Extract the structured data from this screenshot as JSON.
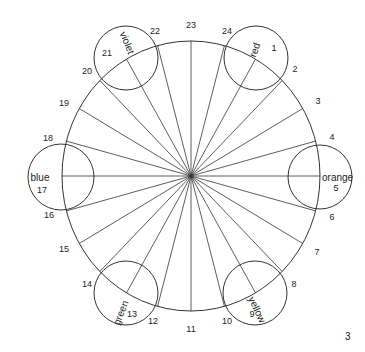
{
  "diagram": {
    "center": {
      "x": 191,
      "y": 176
    },
    "main_circle": {
      "rx": 129,
      "ry": 135
    },
    "stroke_color": "#333333",
    "page_number": "3",
    "segments": [
      {
        "n": "1",
        "x": 274,
        "y": 51
      },
      {
        "n": "2",
        "x": 295,
        "y": 72
      },
      {
        "n": "3",
        "x": 318,
        "y": 104
      },
      {
        "n": "4",
        "x": 332,
        "y": 140
      },
      {
        "n": "5",
        "x": 336,
        "y": 191
      },
      {
        "n": "6",
        "x": 332,
        "y": 220
      },
      {
        "n": "7",
        "x": 317,
        "y": 255
      },
      {
        "n": "8",
        "x": 294,
        "y": 287
      },
      {
        "n": "9",
        "x": 252,
        "y": 317
      },
      {
        "n": "10",
        "x": 227,
        "y": 324
      },
      {
        "n": "11",
        "x": 191,
        "y": 332
      },
      {
        "n": "12",
        "x": 153,
        "y": 324
      },
      {
        "n": "13",
        "x": 132,
        "y": 317
      },
      {
        "n": "14",
        "x": 87,
        "y": 287
      },
      {
        "n": "15",
        "x": 64,
        "y": 252
      },
      {
        "n": "16",
        "x": 49,
        "y": 218
      },
      {
        "n": "17",
        "x": 42,
        "y": 193
      },
      {
        "n": "18",
        "x": 48,
        "y": 141
      },
      {
        "n": "19",
        "x": 64,
        "y": 106
      },
      {
        "n": "20",
        "x": 87,
        "y": 74
      },
      {
        "n": "21",
        "x": 107,
        "y": 56
      },
      {
        "n": "22",
        "x": 155,
        "y": 34
      },
      {
        "n": "23",
        "x": 191,
        "y": 28
      },
      {
        "n": "24",
        "x": 227,
        "y": 34
      }
    ],
    "color_circles": [
      {
        "label": "red",
        "cx": 256,
        "cy": 58,
        "r": 32,
        "tx": 258,
        "ty": 51,
        "rot": -70,
        "anchor": "middle"
      },
      {
        "label": "orange",
        "cx": 320,
        "cy": 177,
        "r": 32,
        "tx": 322,
        "ty": 181,
        "rot": 0,
        "anchor": "start"
      },
      {
        "label": "yellow",
        "cx": 255,
        "cy": 293,
        "r": 32,
        "tx": 254,
        "ty": 311,
        "rot": 65,
        "anchor": "middle"
      },
      {
        "label": "green",
        "cx": 126,
        "cy": 293,
        "r": 32,
        "tx": 124,
        "ty": 314,
        "rot": -68,
        "anchor": "middle"
      },
      {
        "label": "blue",
        "cx": 61,
        "cy": 177,
        "r": 33,
        "tx": 40,
        "ty": 181,
        "rot": 0,
        "anchor": "middle"
      },
      {
        "label": "violet",
        "cx": 126,
        "cy": 58,
        "r": 32,
        "tx": 124,
        "ty": 44,
        "rot": 68,
        "anchor": "middle"
      }
    ]
  }
}
